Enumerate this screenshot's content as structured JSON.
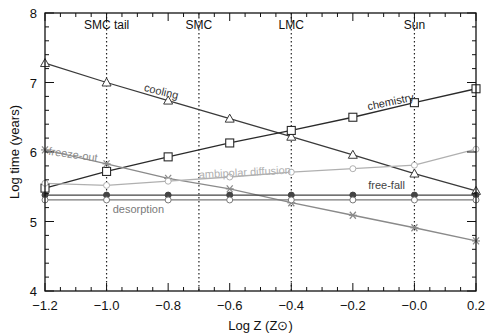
{
  "chart_data": {
    "type": "line",
    "title": "",
    "xlabel": "Log Z (Z⊙)",
    "ylabel": "Log time (years)",
    "xlim": [
      -1.2,
      0.2
    ],
    "ylim": [
      4,
      8
    ],
    "grid": false,
    "x_ticks": [
      -1.2,
      -1.0,
      -0.8,
      -0.6,
      -0.4,
      -0.2,
      0.0,
      0.2
    ],
    "x_tick_labels": [
      "−1.2",
      "−1.0",
      "−0.8",
      "−0.6",
      "−0.4",
      "−0.2",
      "−0.0",
      "0.2"
    ],
    "y_ticks": [
      4,
      5,
      6,
      7,
      8
    ],
    "y_tick_labels": [
      "4",
      "5",
      "6",
      "7",
      "8"
    ],
    "x": [
      -1.2,
      -1.0,
      -0.8,
      -0.6,
      -0.4,
      -0.2,
      0.0,
      0.2
    ],
    "series": [
      {
        "name": "cooling",
        "marker": "triangle",
        "color": "#3a3a3a",
        "values": [
          7.28,
          7.0,
          6.74,
          6.48,
          6.22,
          5.96,
          5.69,
          5.44
        ]
      },
      {
        "name": "chemistry",
        "marker": "square",
        "color": "#2a2a2a",
        "values": [
          5.48,
          5.72,
          5.93,
          6.13,
          6.31,
          6.5,
          6.71,
          6.91
        ]
      },
      {
        "name": "freeze-out",
        "marker": "asterisk",
        "color": "#8a8a8a",
        "values": [
          6.03,
          5.83,
          5.62,
          5.47,
          5.27,
          5.09,
          4.91,
          4.72
        ]
      },
      {
        "name": "ambipolar diffusion",
        "marker": "circle-open",
        "color": "#b0b0b0",
        "values": [
          5.55,
          5.52,
          5.58,
          5.64,
          5.71,
          5.76,
          5.81,
          6.04
        ]
      },
      {
        "name": "free-fall",
        "marker": "circle-filled",
        "color": "#444444",
        "values": [
          5.38,
          5.38,
          5.38,
          5.38,
          5.38,
          5.38,
          5.38,
          5.38
        ]
      },
      {
        "name": "desorption",
        "marker": "circle-open",
        "color": "#7a7a7a",
        "values": [
          5.31,
          5.31,
          5.31,
          5.31,
          5.31,
          5.31,
          5.31,
          5.31
        ]
      }
    ],
    "annotations": [
      {
        "text": "SMC  tail",
        "x": -1.0,
        "type": "vertical-dotted-line"
      },
      {
        "text": "SMC",
        "x": -0.7,
        "type": "vertical-dotted-line"
      },
      {
        "text": "LMC",
        "x": -0.4,
        "type": "vertical-dotted-line"
      },
      {
        "text": "Sun",
        "x": 0.0,
        "type": "vertical-dotted-line"
      }
    ],
    "series_labels": [
      {
        "text": "cooling",
        "x": -0.88,
        "y": 6.88,
        "rotate": 14
      },
      {
        "text": "chemistry",
        "x": -0.15,
        "y": 6.6,
        "rotate": -12
      },
      {
        "text": "freeze-out",
        "x": -1.19,
        "y": 5.96,
        "rotate": 8
      },
      {
        "text": "ambipolar diffusion",
        "x": -0.7,
        "y": 5.62,
        "rotate": -3
      },
      {
        "text": "free-fall",
        "x": -0.15,
        "y": 5.47,
        "rotate": 0
      },
      {
        "text": "desorption",
        "x": -0.98,
        "y": 5.12,
        "rotate": 0
      }
    ]
  }
}
